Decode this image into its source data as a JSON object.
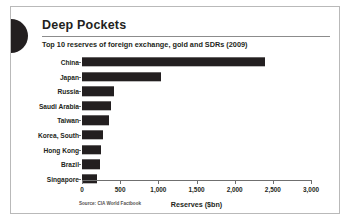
{
  "header": {
    "title": "Deep Pockets",
    "subtitle": "Top 10 reserves of foreign exchange, gold and SDRs (2009)",
    "logo_icon": "half-circle-mark"
  },
  "footer": {
    "source": "Source: CIA World Factbook"
  },
  "colors": {
    "bar": "#231f20",
    "text": "#231f20",
    "axis": "#6f6f6f",
    "frame": "#b9b9b9",
    "rule": "#8c8c8c"
  },
  "chart_data": {
    "type": "bar",
    "orientation": "horizontal",
    "title": "Deep Pockets",
    "subtitle": "Top 10 reserves of foreign exchange, gold and SDRs (2009)",
    "xlabel": "Reserves ($bn)",
    "ylabel": "",
    "xlim": [
      0,
      3000
    ],
    "grid": false,
    "legend": false,
    "source": "Source: CIA World Factbook",
    "xticks": [
      0,
      500,
      1000,
      1500,
      2000,
      2500,
      3000
    ],
    "xtick_labels": [
      "0",
      "500",
      "1,000",
      "1,500",
      "2,000",
      "2,500",
      "3,000"
    ],
    "categories": [
      "China",
      "Japan",
      "Russia",
      "Saudi Arabia",
      "Taiwan",
      "Korea, South",
      "Hong Kong",
      "Brazil",
      "Singapore"
    ],
    "values": [
      2400,
      1030,
      420,
      380,
      350,
      270,
      255,
      240,
      190
    ]
  }
}
